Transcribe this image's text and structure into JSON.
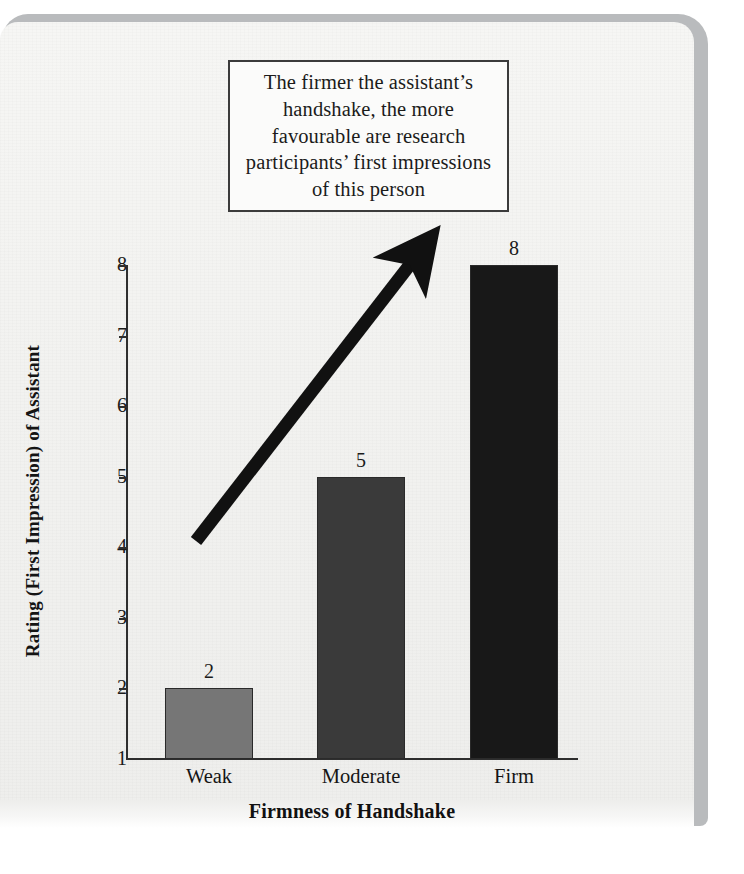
{
  "callout": {
    "text": "The firmer the assistant’s handshake, the more favourable are research participants’ first impressions of this person"
  },
  "chart_data": {
    "type": "bar",
    "title": "",
    "categories": [
      "Weak",
      "Moderate",
      "Firm"
    ],
    "values": [
      2,
      5,
      8
    ],
    "value_labels": [
      "2",
      "5",
      "8"
    ],
    "xlabel": "Firmness of Handshake",
    "ylabel": "Rating (First Impression) of Assistant",
    "ylim": [
      1,
      8
    ],
    "yticks": [
      8,
      7,
      6,
      5,
      4,
      3,
      2,
      1
    ],
    "ytick_labels": [
      "8",
      "7",
      "6",
      "5",
      "4",
      "3",
      "2",
      "1"
    ],
    "grid": false,
    "legend": false,
    "bar_colors": [
      "#767676",
      "#3a3a3a",
      "#181818"
    ],
    "annotation": "upward-trend-arrow"
  },
  "colors": {
    "page": "#f4f4f2",
    "ink": "#1b1b1b",
    "axis": "#2e2e2e",
    "shadow": "#b9bbbd"
  }
}
